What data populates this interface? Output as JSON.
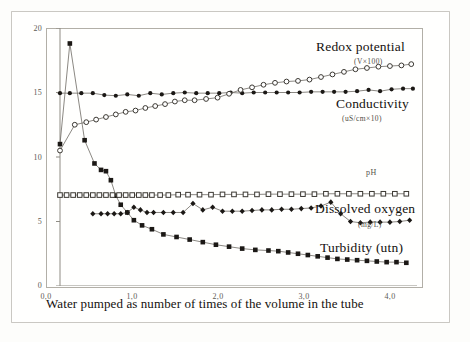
{
  "figure": {
    "caption": "Water pumped as number of times of the volume in the tube",
    "background_note": "scanned-page"
  },
  "annotations": {
    "redox_label": "Redox potential",
    "redox_unit": "(V×100)",
    "conductivity_label": "Conductivity",
    "conductivity_unit": "(uS/cm×10)",
    "ph_label": "pH",
    "do_label": "Dissolved oxygen",
    "do_unit": "(mg/L)",
    "turbidity_label": "Turbidity (utn)"
  },
  "axes": {
    "y_ticks": [
      "0",
      "5",
      "10",
      "15",
      "20"
    ],
    "x_ticks": [
      "0,0",
      "1,0",
      "2,0",
      "3,0",
      "4,0"
    ]
  },
  "chart_data": {
    "type": "line",
    "title": "",
    "subtitle": "",
    "xlabel": "Water pumped as number of times of the volume in the tube",
    "ylabel": "",
    "xlim": [
      0.0,
      4.35
    ],
    "ylim": [
      0,
      20
    ],
    "xticks": [
      0.0,
      1.0,
      2.0,
      3.0,
      4.0
    ],
    "xticklabels": [
      "0,0",
      "1,0",
      "2,0",
      "3,0",
      "4,0"
    ],
    "yticks": [
      0,
      5,
      10,
      15,
      20
    ],
    "yticklabels": [
      "0",
      "5",
      "10",
      "15",
      "20"
    ],
    "grid": false,
    "legend": "inline-annotations",
    "series": [
      {
        "name": "Turbidity (utn)",
        "unit": "utn",
        "marker": "filled-square",
        "x": [
          0.0,
          0.12,
          0.3,
          0.42,
          0.5,
          0.56,
          0.62,
          0.68,
          0.74,
          0.82,
          0.9,
          1.0,
          1.12,
          1.26,
          1.42,
          1.58,
          1.74,
          1.9,
          2.06,
          2.22,
          2.38,
          2.54,
          2.66,
          2.78,
          2.9,
          3.02,
          3.14,
          3.26,
          3.38,
          3.5,
          3.62,
          3.74,
          3.86,
          3.98,
          4.1,
          4.22
        ],
        "y": [
          11.0,
          18.8,
          11.3,
          9.5,
          9.0,
          8.9,
          8.2,
          7.0,
          6.3,
          5.7,
          5.1,
          4.7,
          4.4,
          4.0,
          3.8,
          3.6,
          3.4,
          3.2,
          3.05,
          2.9,
          2.8,
          2.75,
          2.7,
          2.6,
          2.5,
          2.4,
          2.3,
          2.2,
          2.1,
          2.05,
          2.0,
          1.95,
          1.9,
          1.85,
          1.85,
          1.8
        ]
      },
      {
        "name": "Dissolved oxygen (mg/L)",
        "unit": "mg/L",
        "marker": "filled-diamond",
        "x": [
          0.4,
          0.5,
          0.58,
          0.66,
          0.74,
          0.82,
          0.9,
          0.98,
          1.06,
          1.14,
          1.26,
          1.38,
          1.5,
          1.62,
          1.74,
          1.86,
          1.98,
          2.1,
          2.22,
          2.34,
          2.46,
          2.58,
          2.7,
          2.82,
          2.94,
          3.06,
          3.18,
          3.3,
          3.42,
          3.54,
          3.66,
          3.78,
          3.9,
          4.02,
          4.14,
          4.26
        ],
        "y": [
          5.6,
          5.6,
          5.6,
          5.6,
          5.6,
          5.7,
          6.1,
          5.9,
          5.7,
          5.7,
          5.7,
          5.7,
          5.7,
          6.4,
          5.9,
          6.1,
          5.8,
          5.8,
          5.8,
          5.85,
          5.9,
          5.9,
          5.95,
          5.95,
          6.0,
          6.05,
          6.2,
          6.5,
          5.6,
          5.0,
          4.9,
          4.95,
          4.95,
          4.95,
          5.0,
          5.1
        ]
      },
      {
        "name": "pH",
        "unit": "pH",
        "marker": "open-square",
        "x": [
          0.0,
          0.08,
          0.16,
          0.24,
          0.32,
          0.4,
          0.48,
          0.56,
          0.64,
          0.72,
          0.8,
          0.88,
          0.96,
          1.04,
          1.12,
          1.22,
          1.32,
          1.44,
          1.56,
          1.7,
          1.84,
          1.98,
          2.12,
          2.26,
          2.4,
          2.54,
          2.68,
          2.82,
          2.96,
          3.1,
          3.24,
          3.38,
          3.52,
          3.66,
          3.8,
          3.94,
          4.08,
          4.22
        ],
        "y": [
          7.05,
          7.05,
          7.05,
          7.05,
          7.05,
          7.05,
          7.05,
          7.05,
          7.05,
          7.05,
          7.05,
          7.05,
          7.05,
          7.05,
          7.05,
          7.05,
          7.05,
          7.08,
          7.08,
          7.08,
          7.08,
          7.1,
          7.1,
          7.1,
          7.1,
          7.12,
          7.12,
          7.12,
          7.12,
          7.12,
          7.15,
          7.15,
          7.15,
          7.15,
          7.15,
          7.15,
          7.15,
          7.15
        ]
      },
      {
        "name": "Conductivity (uS/cm×10)",
        "unit": "uS/cm x10",
        "marker": "filled-circle",
        "x": [
          0.0,
          0.12,
          0.26,
          0.4,
          0.54,
          0.68,
          0.82,
          0.96,
          1.1,
          1.24,
          1.38,
          1.52,
          1.66,
          1.8,
          1.94,
          2.08,
          2.22,
          2.36,
          2.5,
          2.64,
          2.78,
          2.92,
          3.06,
          3.2,
          3.34,
          3.48,
          3.62,
          3.76,
          3.9,
          4.04,
          4.18,
          4.3
        ],
        "y": [
          14.95,
          14.95,
          14.95,
          14.95,
          14.8,
          14.75,
          14.85,
          14.75,
          14.95,
          14.85,
          14.95,
          15.0,
          14.95,
          14.95,
          14.95,
          15.0,
          14.95,
          15.0,
          15.0,
          15.0,
          15.0,
          15.0,
          15.05,
          15.05,
          15.05,
          15.05,
          15.1,
          15.2,
          15.1,
          15.25,
          15.3,
          15.3
        ]
      },
      {
        "name": "Redox potential (V×100)",
        "unit": "V x100",
        "marker": "open-circle",
        "x": [
          0.0,
          0.18,
          0.32,
          0.44,
          0.56,
          0.68,
          0.8,
          0.92,
          1.04,
          1.16,
          1.28,
          1.4,
          1.52,
          1.64,
          1.78,
          1.92,
          2.06,
          2.2,
          2.34,
          2.48,
          2.62,
          2.76,
          2.9,
          3.04,
          3.18,
          3.32,
          3.46,
          3.6,
          3.74,
          3.88,
          4.02,
          4.16,
          4.28
        ],
        "y": [
          10.5,
          12.5,
          12.7,
          12.9,
          13.1,
          13.3,
          13.5,
          13.6,
          13.8,
          13.95,
          14.1,
          14.3,
          14.4,
          14.4,
          14.5,
          14.6,
          14.9,
          15.2,
          15.4,
          15.6,
          15.75,
          15.85,
          15.9,
          16.0,
          16.2,
          16.4,
          16.6,
          16.8,
          16.9,
          17.0,
          17.05,
          17.1,
          17.2
        ]
      }
    ]
  }
}
